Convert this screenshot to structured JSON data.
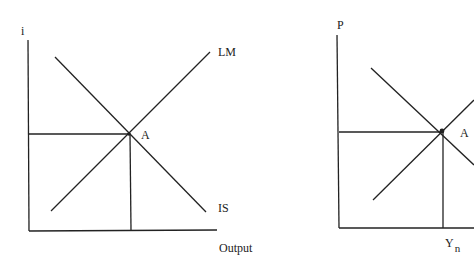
{
  "left_diagram": {
    "title": "IS-LM model",
    "y_axis_label": "i",
    "x_axis_label": "Output",
    "curves": [
      {
        "name": "LM",
        "label": "LM",
        "slope": "upward"
      },
      {
        "name": "IS",
        "label": "IS",
        "slope": "downward"
      }
    ],
    "equilibrium_label": "A"
  },
  "right_diagram": {
    "title": "AS-AD model",
    "y_axis_label": "P",
    "x_axis_tick_label": "Y",
    "x_axis_tick_subscript": "n",
    "curves": [
      {
        "name": "AD",
        "slope": "downward"
      },
      {
        "name": "AS",
        "slope": "upward"
      }
    ],
    "equilibrium_label": "A"
  },
  "colors": {
    "line": "#222222",
    "background": "#ffffff"
  }
}
